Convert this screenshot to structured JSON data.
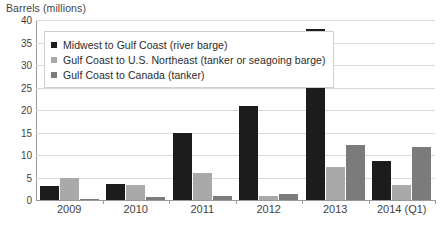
{
  "chart_data": {
    "type": "bar",
    "title": "Barrels (millions)",
    "xlabel": "",
    "ylabel": "Barrels (millions)",
    "ylim": [
      0,
      40
    ],
    "ytick_step": 5,
    "yticks": [
      "0",
      "5",
      "10",
      "15",
      "20",
      "25",
      "30",
      "35",
      "40"
    ],
    "grid": true,
    "legend_position": "top-left",
    "categories": [
      "2009",
      "2010",
      "2011",
      "2012",
      "2013",
      "2014 (Q1)"
    ],
    "series": [
      {
        "name": "Midwest to Gulf Coast (river barge)",
        "color": "#1c1c1c",
        "values": [
          3.2,
          3.6,
          15.0,
          21.0,
          38.0,
          8.6
        ]
      },
      {
        "name": "Gulf Coast to U.S. Northeast (tanker or seagoing barge)",
        "color": "#a9a9a9",
        "values": [
          5.0,
          3.4,
          6.0,
          0.9,
          7.4,
          3.4
        ]
      },
      {
        "name": "Gulf Coast to Canada (tanker)",
        "color": "#7b7b7b",
        "values": [
          0.2,
          0.6,
          0.9,
          1.4,
          12.2,
          11.8
        ]
      }
    ]
  },
  "colors": {
    "series_1": "#1c1c1c",
    "series_2": "#a9a9a9",
    "series_3": "#7b7b7b",
    "gridline": "#d9d9d9",
    "axis": "#9a9a9a",
    "text": "#3f3f3f",
    "background": "#ffffff"
  }
}
